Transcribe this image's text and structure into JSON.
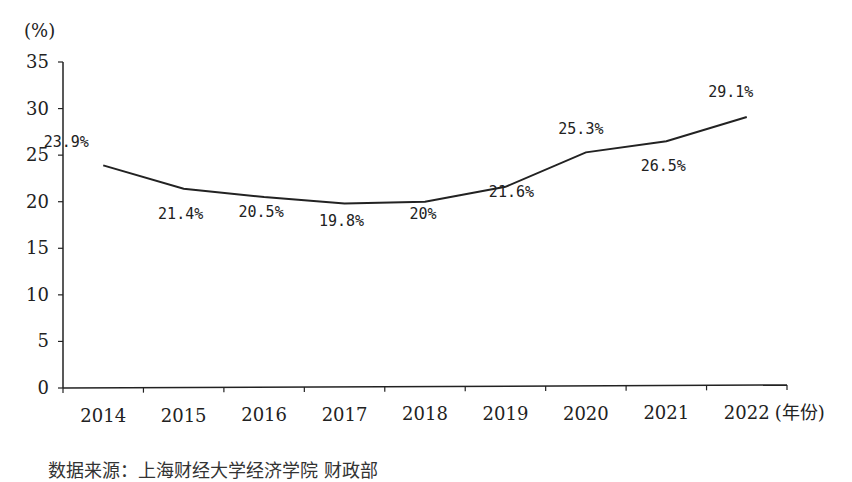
{
  "chart_data": {
    "type": "line",
    "title": "",
    "ylabel": "(%)",
    "xlabel": "(年份)",
    "ylim": [
      0,
      35
    ],
    "yticks": [
      0,
      5,
      10,
      15,
      20,
      25,
      30,
      35
    ],
    "categories": [
      "2014",
      "2015",
      "2016",
      "2017",
      "2018",
      "2019",
      "2020",
      "2021",
      "2022"
    ],
    "series": [
      {
        "name": "",
        "values": [
          23.9,
          21.4,
          20.5,
          19.8,
          20,
          21.6,
          25.3,
          26.5,
          29.1
        ],
        "labels": [
          "23.9%",
          "21.4%",
          "20.5%",
          "19.8%",
          "20%",
          "21.6%",
          "25.3%",
          "26.5%",
          "29.1%"
        ]
      }
    ],
    "grid": false,
    "legend": "none"
  },
  "caption": "数据来源：上海财经大学经济学院 财政部"
}
